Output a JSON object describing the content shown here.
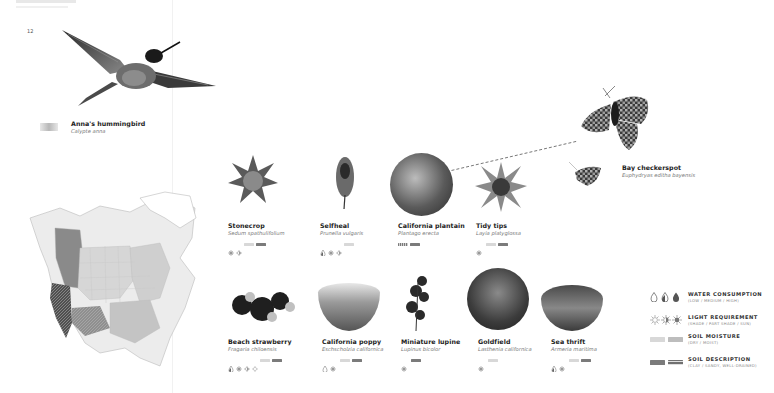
{
  "page": {
    "number": "12"
  },
  "hummingbird": {
    "name": "Anna's hummingbird",
    "scientific": "Calypte anna"
  },
  "butterfly": {
    "name": "Bay checkerspot",
    "scientific": "Euphydryas editha bayensis"
  },
  "plants": [
    {
      "name": "Stonecrop",
      "scientific": "Sedum spathulifolium",
      "water": [],
      "light": [
        "sun",
        "part-shade"
      ],
      "moisture": [
        "dry"
      ],
      "soil": [
        "clay"
      ]
    },
    {
      "name": "Selfheal",
      "scientific": "Prunella vulgaris",
      "water": [
        "medium"
      ],
      "light": [
        "sun",
        "part-shade"
      ],
      "moisture": [
        "dry"
      ],
      "soil": []
    },
    {
      "name": "California plantain",
      "scientific": "Plantago erecta",
      "water": [],
      "light": [],
      "moisture": [],
      "soil": [
        "sandy",
        "clay"
      ]
    },
    {
      "name": "Tidy tips",
      "scientific": "Layia platyglossa",
      "water": [],
      "light": [
        "sun"
      ],
      "moisture": [
        "dry"
      ],
      "soil": [
        "clay"
      ]
    },
    {
      "name": "Beach strawberry",
      "scientific": "Fragaria chiloensis",
      "water": [
        "medium"
      ],
      "light": [
        "sun",
        "part-shade",
        "shade"
      ],
      "moisture": [
        "dry"
      ],
      "soil": [
        "clay"
      ]
    },
    {
      "name": "California poppy",
      "scientific": "Eschscholzia californica",
      "water": [
        "low"
      ],
      "light": [
        "sun"
      ],
      "moisture": [
        "dry"
      ],
      "soil": [
        "clay"
      ]
    },
    {
      "name": "Miniature lupine",
      "scientific": "Lupinus bicolor",
      "water": [],
      "light": [
        "sun"
      ],
      "moisture": [],
      "soil": [
        "clay"
      ]
    },
    {
      "name": "Goldfield",
      "scientific": "Lasthenia californica",
      "water": [],
      "light": [
        "sun"
      ],
      "moisture": [
        "dry"
      ],
      "soil": []
    },
    {
      "name": "Sea thrift",
      "scientific": "Armeria maritima",
      "water": [
        "medium"
      ],
      "light": [
        "sun"
      ],
      "moisture": [
        "dry"
      ],
      "soil": [
        "clay"
      ]
    }
  ],
  "legend": [
    {
      "title": "WATER CONSUMPTION",
      "sub": "(LOW / MEDIUM / HIGH)"
    },
    {
      "title": "LIGHT REQUIREMENT",
      "sub": "(SHADE / PART SHADE / SUN)"
    },
    {
      "title": "SOIL MOISTURE",
      "sub": "(DRY / MOIST)"
    },
    {
      "title": "SOIL DESCRIPTION",
      "sub": "(CLAY / SANDY, WELL-DRAINED)"
    }
  ]
}
